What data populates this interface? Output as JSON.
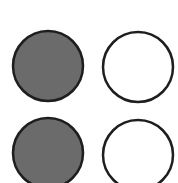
{
  "diagram": {
    "background": "#ffffff",
    "stroke_color": "#1e1e1e",
    "filled_color": "#6b6b6b",
    "empty_color": "#ffffff",
    "circles": [
      {
        "row": 1,
        "col": 1,
        "cx": 48,
        "cy": 66,
        "r": 35,
        "state": "filled"
      },
      {
        "row": 1,
        "col": 2,
        "cx": 138,
        "cy": 67,
        "r": 35,
        "state": "empty"
      },
      {
        "row": 2,
        "col": 1,
        "cx": 48,
        "cy": 153,
        "r": 35,
        "state": "filled"
      },
      {
        "row": 2,
        "col": 2,
        "cx": 138,
        "cy": 155,
        "r": 35,
        "state": "empty"
      }
    ]
  }
}
